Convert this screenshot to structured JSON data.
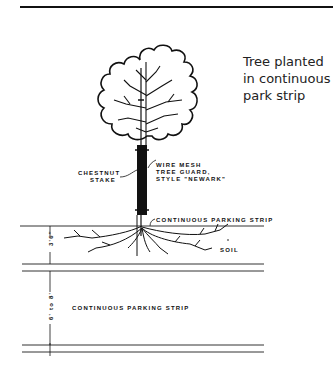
{
  "caption": {
    "lines": [
      "Tree planted",
      "in continuous",
      "park strip"
    ]
  },
  "labels": {
    "stake": [
      "CHESTNUT",
      "STAKE"
    ],
    "guard": [
      "WIRE MESH",
      "TREE GUARD,",
      "STYLE \"NEWARK\""
    ],
    "parking_strip_top": "CONTINUOUS PARKING STRIP",
    "soil": "SOIL",
    "parking_strip_lower": "CONTINUOUS PARKING STRIP"
  },
  "dimensions": {
    "soil_depth": "3'6\"",
    "strip_width": "6' to 8'",
    "curb": "6\""
  }
}
